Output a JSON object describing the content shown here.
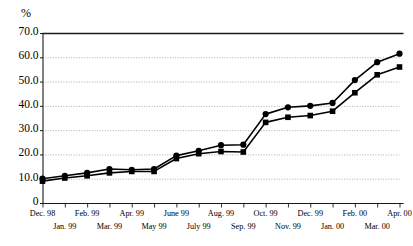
{
  "chart_data": {
    "type": "line",
    "title": "",
    "subtitle": "",
    "xlabel": "",
    "ylabel": "%",
    "unit_label": "%",
    "ylim": [
      0,
      70
    ],
    "ytick_labels": [
      "70.0",
      "60.0",
      "50.0",
      "40.0",
      "30.0",
      "20.0",
      "10.0",
      "0"
    ],
    "ytick_values": [
      70,
      60,
      50,
      40,
      30,
      20,
      10,
      0
    ],
    "grid": "horizontal-dotted",
    "legend": "none",
    "categories": [
      "Dec. 98",
      "Jan. 99",
      "Feb. 99",
      "Mar. 99",
      "Apr. 99",
      "May 99",
      "June 99",
      "July 99",
      "Aug. 99",
      "Sep. 99",
      "Oct. 99",
      "Nov. 99",
      "Dec. 99",
      "Jan. 00",
      "Feb. 00",
      "Mar. 00",
      "Apr. 00"
    ],
    "xtick_labels_top_row": [
      "Dec. 98",
      "Feb. 99",
      "Apr. 99",
      "June 99",
      "Aug. 99",
      "Oct. 99",
      "Dec. 99",
      "Feb. 00",
      "Apr. 00"
    ],
    "xtick_labels_bottom_row": [
      "Jan. 99",
      "Mar. 99",
      "May 99",
      "July 99",
      "Sep. 99",
      "Nov. 99",
      "Jan. 00",
      "Mar. 00"
    ],
    "series": [
      {
        "name": "Series 1",
        "marker": "circle",
        "color": "#000000",
        "values": [
          10.0,
          11.2,
          12.4,
          14.0,
          13.7,
          14.0,
          19.5,
          21.5,
          23.8,
          24.0,
          36.6,
          39.4,
          40.0,
          41.2,
          50.6,
          58.0,
          61.5
        ]
      },
      {
        "name": "Series 2",
        "marker": "square",
        "color": "#000000",
        "values": [
          9.0,
          10.3,
          11.2,
          12.4,
          13.0,
          13.0,
          18.3,
          20.3,
          21.2,
          21.0,
          33.2,
          35.3,
          36.0,
          37.8,
          45.4,
          52.8,
          56.0
        ]
      }
    ]
  },
  "axes": {
    "top_border": true,
    "left_axis": true,
    "bottom_axis": true
  }
}
